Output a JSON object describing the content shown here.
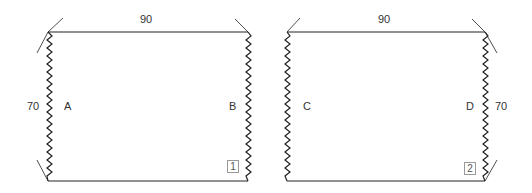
{
  "panels": [
    {
      "id": 1,
      "top_dimension": "90",
      "side_dimension": "70",
      "left_label": "A",
      "right_label": "B",
      "piece_number": "1"
    },
    {
      "id": 2,
      "top_dimension": "90",
      "side_dimension": "70",
      "left_label": "C",
      "right_label": "D",
      "piece_number": "2"
    }
  ],
  "colors": {
    "line": "#222222",
    "text": "#333333"
  }
}
